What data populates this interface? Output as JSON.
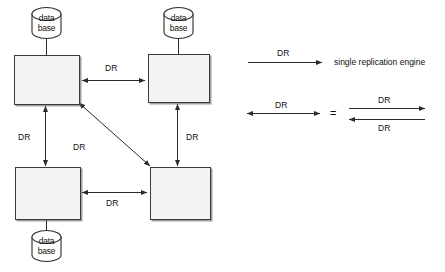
{
  "diagram": {
    "stroke_color": "#3a3a3a",
    "box_fill": "#f3f3f3",
    "nodes": [
      {
        "id": "node-top-left",
        "database_line1": "data",
        "database_line2": "base",
        "db_position": "above"
      },
      {
        "id": "node-top-right",
        "database_line1": "data",
        "database_line2": "base",
        "db_position": "above"
      },
      {
        "id": "node-bottom-left",
        "database_line1": "data",
        "database_line2": "base",
        "db_position": "below"
      },
      {
        "id": "node-bottom-right",
        "database_line1": "",
        "database_line2": "",
        "db_position": "none"
      }
    ],
    "edges": [
      {
        "id": "edge-top",
        "label": "DR",
        "from": "node-top-left",
        "to": "node-top-right",
        "direction": "bidirectional"
      },
      {
        "id": "edge-left",
        "label": "DR",
        "from": "node-top-left",
        "to": "node-bottom-left",
        "direction": "bidirectional"
      },
      {
        "id": "edge-right",
        "label": "DR",
        "from": "node-top-right",
        "to": "node-bottom-right",
        "direction": "bidirectional"
      },
      {
        "id": "edge-bottom",
        "label": "DR",
        "from": "node-bottom-left",
        "to": "node-bottom-right",
        "direction": "bidirectional"
      },
      {
        "id": "edge-diagonal",
        "label": "DR",
        "from": "node-top-left",
        "to": "node-bottom-right",
        "direction": "bidirectional"
      }
    ]
  },
  "legend": {
    "row1": {
      "arrow_label": "DR",
      "description": "single replication engine",
      "direction": "unidirectional"
    },
    "row2": {
      "left_arrow_label": "DR",
      "equals": "=",
      "right_top_label": "DR",
      "right_bottom_label": "DR",
      "left_direction": "bidirectional"
    }
  }
}
